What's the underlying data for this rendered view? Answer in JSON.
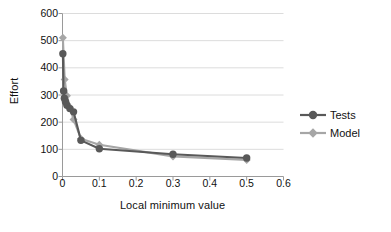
{
  "chart_data": {
    "type": "line",
    "title": "",
    "subtitle": "",
    "xlabel": "Local minimum value",
    "ylabel": "Effort",
    "xlim": [
      0,
      0.6
    ],
    "ylim": [
      0,
      600
    ],
    "xticks": [
      "0",
      "0.1",
      "0.2",
      "0.3",
      "0.4",
      "0.5",
      "0.6"
    ],
    "xtick_values": [
      0,
      0.1,
      0.2,
      0.3,
      0.4,
      0.5,
      0.6
    ],
    "yticks": [
      "0",
      "100",
      "200",
      "300",
      "400",
      "500",
      "600"
    ],
    "ytick_values": [
      0,
      100,
      200,
      300,
      400,
      500,
      600
    ],
    "grid": "horizontal",
    "legend_position": "right",
    "series": [
      {
        "name": "Tests",
        "color": "#595959",
        "marker": "circle",
        "x": [
          0.001,
          0.003,
          0.005,
          0.008,
          0.012,
          0.02,
          0.03,
          0.05,
          0.1,
          0.3,
          0.5
        ],
        "y": [
          452,
          315,
          288,
          275,
          262,
          250,
          238,
          133,
          102,
          82,
          68
        ]
      },
      {
        "name": "Model",
        "color": "#a6a6a6",
        "marker": "diamond",
        "x": [
          0.001,
          0.006,
          0.012,
          0.02,
          0.03,
          0.05,
          0.1,
          0.3,
          0.5
        ],
        "y": [
          511,
          357,
          297,
          255,
          210,
          139,
          117,
          74,
          61
        ]
      }
    ]
  },
  "legend": {
    "items": [
      {
        "label": "Tests",
        "color": "#595959",
        "marker": "circle"
      },
      {
        "label": "Model",
        "color": "#a6a6a6",
        "marker": "diamond"
      }
    ]
  },
  "axes": {
    "y_title": "Effort",
    "x_title": "Local minimum value"
  }
}
